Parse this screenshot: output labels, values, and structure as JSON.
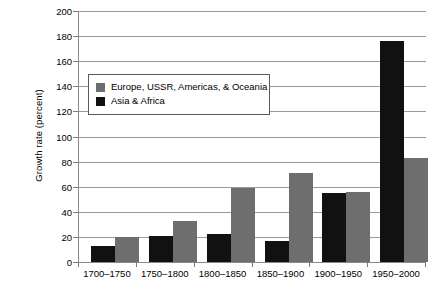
{
  "chart_data": {
    "type": "bar",
    "title": "",
    "xlabel": "",
    "ylabel": "Growth rate (percent)",
    "ylim": [
      0,
      200
    ],
    "ytick_step": 20,
    "yticks": [
      0,
      20,
      40,
      60,
      80,
      100,
      120,
      140,
      160,
      180,
      200
    ],
    "grid": true,
    "legend_position": "upper-left-inside",
    "categories": [
      "1700–1750",
      "1750–1800",
      "1800–1850",
      "1850–1900",
      "1900–1950",
      "1950–2000"
    ],
    "series": [
      {
        "name": "Asia & Africa",
        "color": "#111111",
        "values": [
          13,
          21,
          22,
          17,
          55,
          176
        ]
      },
      {
        "name": "Europe, USSR, Americas, & Oceania",
        "color": "#6e6e6e",
        "values": [
          20,
          33,
          59,
          71,
          56,
          83
        ]
      }
    ]
  },
  "legend": {
    "items": [
      {
        "label": "Europe, USSR, Americas, & Oceania",
        "color": "#6e6e6e"
      },
      {
        "label": "Asia & Africa",
        "color": "#111111"
      }
    ]
  },
  "axes": {
    "y_title": "Growth rate (percent)",
    "y_labels": [
      "200",
      "180",
      "160",
      "140",
      "120",
      "100",
      "80",
      "60",
      "40",
      "20",
      "0"
    ],
    "x_labels": [
      "1700–1750",
      "1750–1800",
      "1800–1850",
      "1850–1900",
      "1900–1950",
      "1950–2000"
    ]
  }
}
